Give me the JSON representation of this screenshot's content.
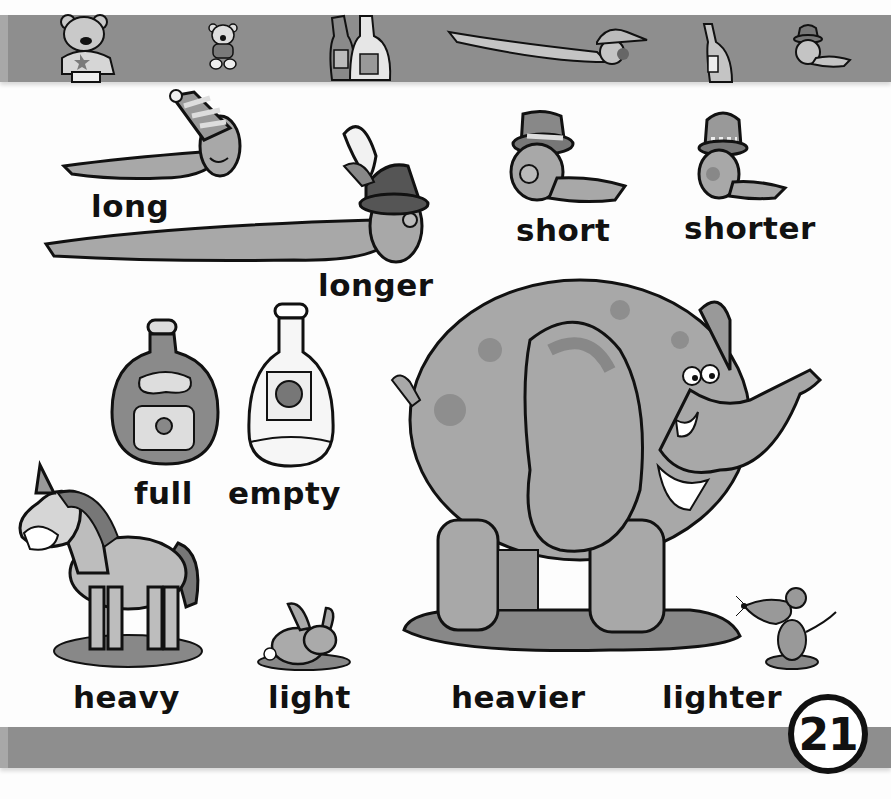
{
  "page": {
    "number": "21",
    "colors": {
      "band": "#8e8e8e",
      "ink": "#111111",
      "background": "#fdfdfd",
      "fill_light": "#c9c9c9",
      "fill_mid": "#a6a6a6",
      "fill_dark": "#6e6e6e"
    }
  },
  "top_band": {
    "icons": [
      "bear-big-icon",
      "bear-small-icon",
      "bottles-icon",
      "worm-cap-icon",
      "bottle-icon",
      "worm-hat-icon"
    ]
  },
  "vocabulary": [
    {
      "id": "long",
      "word": "long",
      "picture": "worm-striped-hat"
    },
    {
      "id": "longer",
      "word": "longer",
      "picture": "worm-feather-hat"
    },
    {
      "id": "short",
      "word": "short",
      "picture": "worm-top-hat"
    },
    {
      "id": "shorter",
      "word": "shorter",
      "picture": "worm-striped-top-hat"
    },
    {
      "id": "full",
      "word": "full",
      "picture": "full-bottle"
    },
    {
      "id": "empty",
      "word": "empty",
      "picture": "empty-bottle"
    },
    {
      "id": "heavy",
      "word": "heavy",
      "picture": "horse"
    },
    {
      "id": "light",
      "word": "light",
      "picture": "rabbit"
    },
    {
      "id": "heavier",
      "word": "heavier",
      "picture": "elephant"
    },
    {
      "id": "lighter",
      "word": "lighter",
      "picture": "mouse"
    }
  ]
}
